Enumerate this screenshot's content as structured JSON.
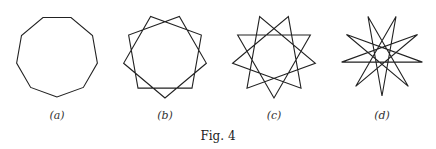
{
  "figure": {
    "caption": "Fig. 4",
    "panels": [
      {
        "id": "a",
        "label": "(a)",
        "shape": "regular nonagon",
        "schlafli": "{9/1}",
        "cx": 57,
        "cy": 56,
        "r": 41,
        "step": 1,
        "color": "#222222"
      },
      {
        "id": "b",
        "label": "(b)",
        "shape": "star nonagon",
        "schlafli": "{9/2}",
        "cx": 165,
        "cy": 56,
        "r": 42,
        "step": 2,
        "color": "#222222"
      },
      {
        "id": "c",
        "label": "(c)",
        "shape": "star nonagon (three triangles)",
        "schlafli": "{9/3}",
        "cx": 274,
        "cy": 56,
        "r": 42,
        "step": 3,
        "color": "#222222"
      },
      {
        "id": "d",
        "label": "(d)",
        "shape": "star nonagon",
        "schlafli": "{9/4}",
        "cx": 382,
        "cy": 55,
        "r": 41,
        "step": 4,
        "color": "#222222"
      }
    ],
    "label_y": 119,
    "caption_pos": {
      "x": 218,
      "y": 140
    }
  }
}
